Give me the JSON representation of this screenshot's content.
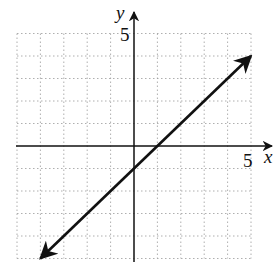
{
  "chart_data": {
    "type": "line",
    "title": "",
    "xlabel": "x",
    "ylabel": "y",
    "xlim": [
      -5,
      5
    ],
    "ylim": [
      -5,
      5
    ],
    "grid": true,
    "grid_style": "dotted",
    "tick_labels": {
      "x": [
        "5"
      ],
      "y": [
        "5"
      ]
    },
    "series": [
      {
        "name": "y = x - 1",
        "equation": "y = x - 1",
        "slope": 1,
        "intercept": -1,
        "x": [
          -4,
          0,
          1,
          5
        ],
        "y": [
          -5,
          -1,
          0,
          4
        ],
        "arrows_both_ends": true
      }
    ]
  },
  "labels": {
    "x_axis": "x",
    "y_axis": "y",
    "x_tick": "5",
    "y_tick": "5"
  },
  "colors": {
    "line": "#111111",
    "grid": "#9a9a9a",
    "axis": "#111111"
  }
}
